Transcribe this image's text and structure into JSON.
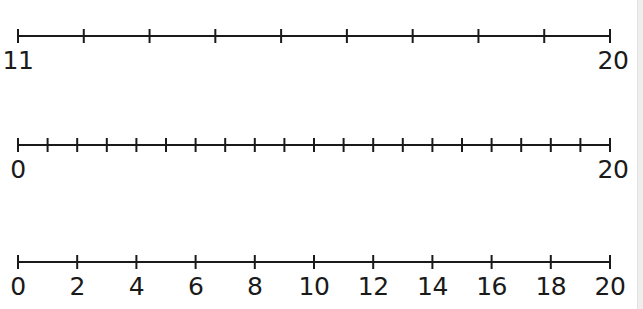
{
  "number_lines": [
    {
      "id": "line-11-to-20",
      "start": 11,
      "end": 20,
      "tick_step": 1,
      "y": 36,
      "x_start": 18,
      "x_end": 610,
      "labels": [
        {
          "value": "11",
          "at": 11
        },
        {
          "value": "20",
          "at": 20
        }
      ]
    },
    {
      "id": "line-0-to-20-by-1",
      "start": 0,
      "end": 20,
      "tick_step": 1,
      "y": 145,
      "x_start": 18,
      "x_end": 610,
      "labels": [
        {
          "value": "0",
          "at": 0
        },
        {
          "value": "20",
          "at": 20
        }
      ]
    },
    {
      "id": "line-0-to-20-by-2",
      "start": 0,
      "end": 20,
      "tick_step": 2,
      "y": 262,
      "x_start": 18,
      "x_end": 610,
      "labels": [
        {
          "value": "0",
          "at": 0
        },
        {
          "value": "2",
          "at": 2
        },
        {
          "value": "4",
          "at": 4
        },
        {
          "value": "6",
          "at": 6
        },
        {
          "value": "8",
          "at": 8
        },
        {
          "value": "10",
          "at": 10
        },
        {
          "value": "12",
          "at": 12
        },
        {
          "value": "14",
          "at": 14
        },
        {
          "value": "16",
          "at": 16
        },
        {
          "value": "18",
          "at": 18
        },
        {
          "value": "20",
          "at": 20
        }
      ]
    }
  ],
  "style": {
    "line_color": "#1a1a1a",
    "edge_strip_color": "#eeeeee"
  }
}
